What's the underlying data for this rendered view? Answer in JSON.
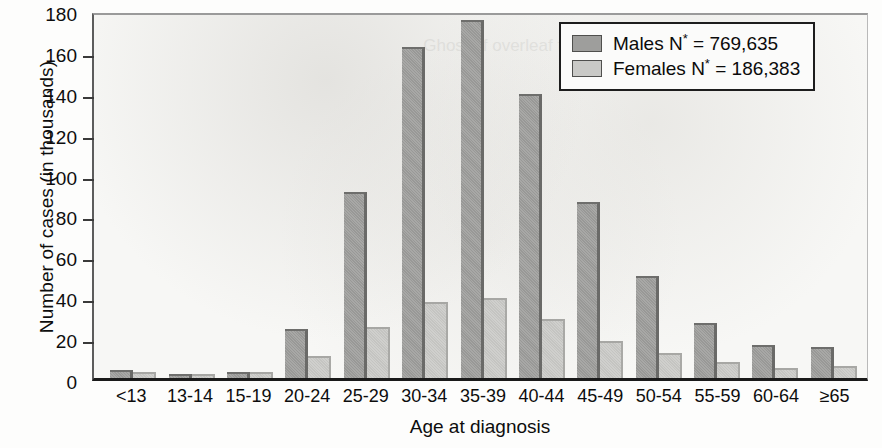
{
  "chart_data": {
    "type": "bar",
    "title": "",
    "xlabel": "Age at diagnosis",
    "ylabel": "Number of cases (in thousands)",
    "categories": [
      "<13",
      "13-14",
      "15-19",
      "20-24",
      "25-29",
      "30-34",
      "35-39",
      "40-44",
      "45-49",
      "50-54",
      "55-59",
      "60-64",
      "≥65"
    ],
    "series": [
      {
        "name": "Males",
        "legend_label": "Males N",
        "legend_sup": "*",
        "legend_value": " = 769,635",
        "color": "#9e9e9c",
        "values": [
          4,
          2,
          3,
          24,
          91,
          162,
          175,
          139,
          86,
          50,
          27,
          16,
          15
        ]
      },
      {
        "name": "Females",
        "legend_label": "Females N",
        "legend_sup": "*",
        "legend_value": " = 186,383",
        "color": "#c9c9c6",
        "values": [
          3,
          2,
          3,
          11,
          25,
          37,
          39,
          29,
          18,
          12,
          8,
          5,
          6
        ]
      }
    ],
    "ylim": [
      0,
      180
    ],
    "yticks": [
      0,
      20,
      40,
      60,
      80,
      100,
      120,
      140,
      160,
      180
    ],
    "grid": false,
    "legend_position": "top-right"
  },
  "ghost_text": "Ghost of overleaf text"
}
